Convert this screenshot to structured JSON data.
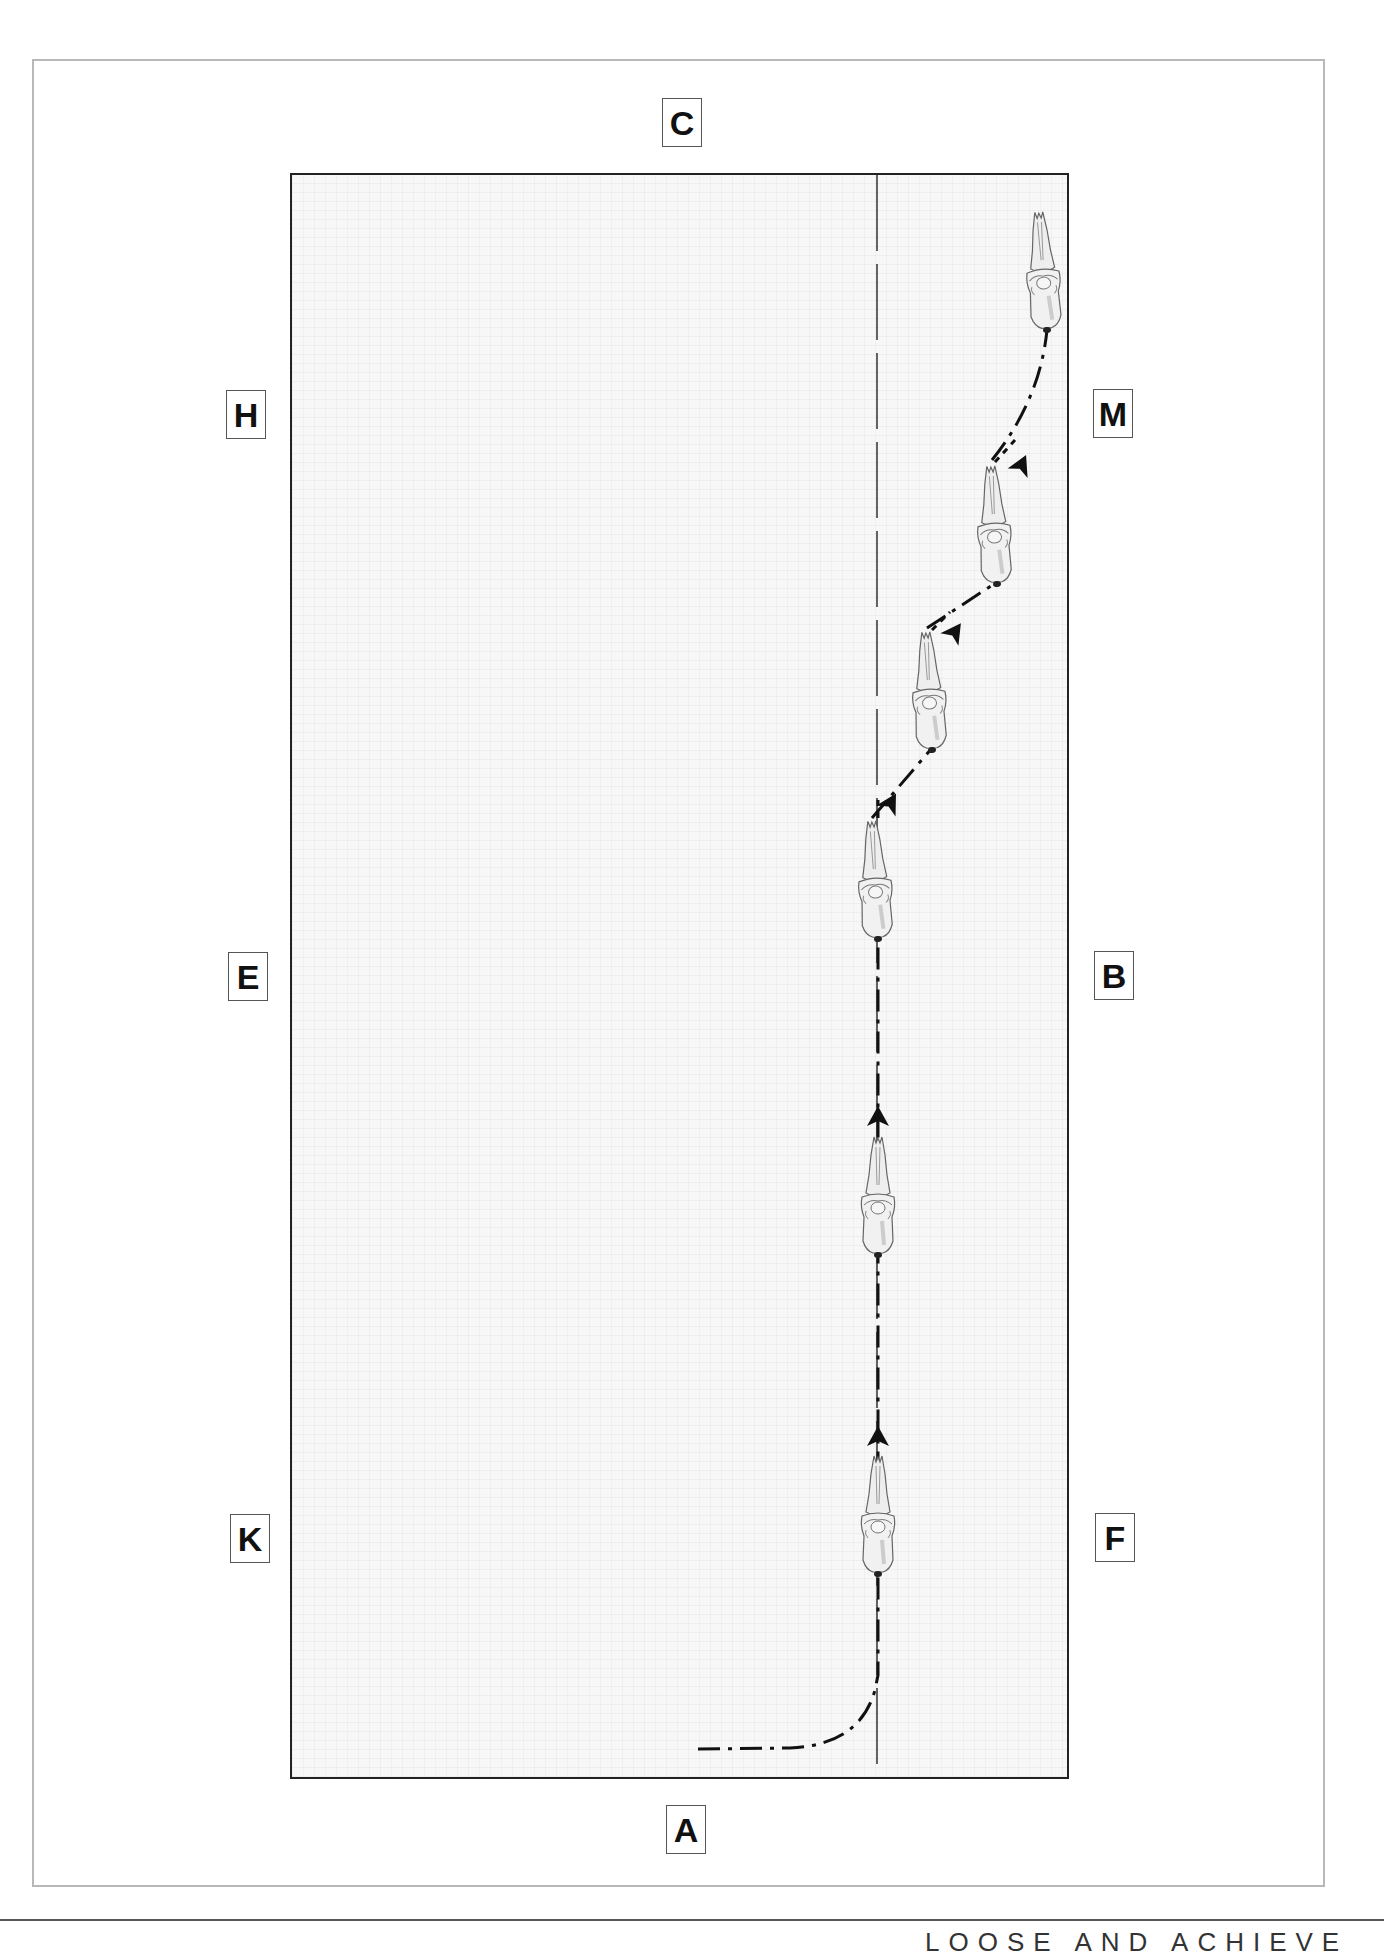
{
  "diagram": {
    "type": "dressage-arena-movement",
    "arena_letters": {
      "top": "C",
      "bottom": "A",
      "left": [
        "H",
        "E",
        "K"
      ],
      "right": [
        "M",
        "B",
        "F"
      ]
    },
    "path_description": "Enter at A, turn onto inner track, ride straight then leg-yield/diagonal toward M",
    "horse_count": 6,
    "footer_text": "LOOSE AND ACHIEVE"
  },
  "colors": {
    "frame": "#b8b8b8",
    "arena_border": "#222222",
    "arena_fill": "#f7f7f7",
    "path": "#111111"
  }
}
